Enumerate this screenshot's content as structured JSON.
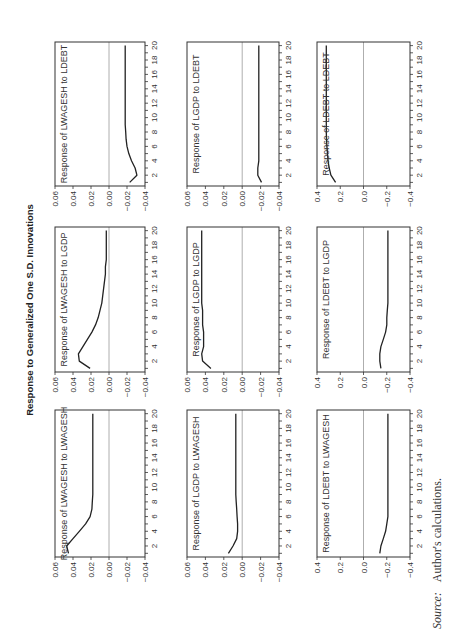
{
  "chart_data": {
    "type": "line",
    "title": "Response to Generalized One S.D. Innovations",
    "orientation_note": "figure rotated 90 degrees counter-clockwise on page",
    "x": [
      1,
      2,
      3,
      4,
      5,
      6,
      7,
      8,
      9,
      10,
      11,
      12,
      13,
      14,
      15,
      16,
      17,
      18,
      19,
      20
    ],
    "xticks": [
      2,
      4,
      6,
      8,
      10,
      12,
      14,
      16,
      18,
      20
    ],
    "panels": [
      {
        "row": 0,
        "col": 0,
        "title": "Response of LWAGESH to LWAGESH",
        "ylim": [
          -0.04,
          0.06
        ],
        "yticks": [
          0.06,
          0.04,
          0.02,
          0.0,
          -0.02,
          -0.04
        ],
        "ytick_labels": [
          "0.06",
          "0.04",
          "0.02",
          "0.00",
          "−0.02",
          "−0.04"
        ],
        "values": [
          0.045,
          0.047,
          0.04,
          0.033,
          0.026,
          0.021,
          0.019,
          0.0185,
          0.018,
          0.018,
          0.018,
          0.018,
          0.018,
          0.018,
          0.018,
          0.018,
          0.018,
          0.018,
          0.018,
          0.018
        ]
      },
      {
        "row": 0,
        "col": 1,
        "title": "Response of LWAGESH to LGDP",
        "ylim": [
          -0.04,
          0.06
        ],
        "yticks": [
          0.06,
          0.04,
          0.02,
          0.0,
          -0.02,
          -0.04
        ],
        "ytick_labels": [
          "0.06",
          "0.04",
          "0.02",
          "0.00",
          "−0.02",
          "−0.04"
        ],
        "values": [
          0.021,
          0.033,
          0.034,
          0.029,
          0.024,
          0.019,
          0.015,
          0.012,
          0.01,
          0.008,
          0.007,
          0.006,
          0.005,
          0.004,
          0.004,
          0.003,
          0.003,
          0.003,
          0.003,
          0.003
        ]
      },
      {
        "row": 0,
        "col": 2,
        "title": "Response of LWAGESH to LDEBT",
        "ylim": [
          -0.04,
          0.06
        ],
        "yticks": [
          0.06,
          0.04,
          0.02,
          0.0,
          -0.02,
          -0.04
        ],
        "ytick_labels": [
          "0.06",
          "0.04",
          "0.02",
          "0.00",
          "−0.02",
          "−0.04"
        ],
        "values": [
          -0.023,
          -0.031,
          -0.029,
          -0.025,
          -0.022,
          -0.02,
          -0.019,
          -0.0185,
          -0.018,
          -0.018,
          -0.018,
          -0.018,
          -0.018,
          -0.018,
          -0.018,
          -0.018,
          -0.018,
          -0.018,
          -0.018,
          -0.018
        ]
      },
      {
        "row": 1,
        "col": 0,
        "title": "Response of LGDP to LWAGESH",
        "ylim": [
          -0.04,
          0.06
        ],
        "yticks": [
          0.06,
          0.04,
          0.02,
          0.0,
          -0.02,
          -0.04
        ],
        "ytick_labels": [
          "0.06",
          "0.04",
          "0.02",
          "0.00",
          "−0.02",
          "−0.04"
        ],
        "values": [
          0.015,
          0.01,
          0.006,
          0.005,
          0.005,
          0.0055,
          0.006,
          0.0065,
          0.007,
          0.007,
          0.007,
          0.007,
          0.007,
          0.007,
          0.007,
          0.007,
          0.007,
          0.007,
          0.007,
          0.007
        ]
      },
      {
        "row": 1,
        "col": 1,
        "title": "Response of LGDP to LGDP",
        "ylim": [
          -0.04,
          0.06
        ],
        "yticks": [
          0.06,
          0.04,
          0.02,
          0.0,
          -0.02,
          -0.04
        ],
        "ytick_labels": [
          "0.06",
          "0.04",
          "0.02",
          "0.00",
          "−0.02",
          "−0.04"
        ],
        "values": [
          0.034,
          0.043,
          0.044,
          0.042,
          0.042,
          0.042,
          0.043,
          0.043,
          0.043,
          0.044,
          0.044,
          0.044,
          0.044,
          0.044,
          0.044,
          0.044,
          0.044,
          0.044,
          0.044,
          0.044
        ]
      },
      {
        "row": 1,
        "col": 2,
        "title": "Response of LGDP to LDEBT",
        "ylim": [
          -0.04,
          0.06
        ],
        "yticks": [
          0.06,
          0.04,
          0.02,
          0.0,
          -0.02,
          -0.04
        ],
        "ytick_labels": [
          "0.06",
          "0.04",
          "0.02",
          "0.00",
          "−0.02",
          "−0.04"
        ],
        "values": [
          -0.021,
          -0.017,
          -0.017,
          -0.018,
          -0.018,
          -0.018,
          -0.018,
          -0.018,
          -0.018,
          -0.018,
          -0.018,
          -0.018,
          -0.018,
          -0.018,
          -0.018,
          -0.018,
          -0.018,
          -0.018,
          -0.018,
          -0.018
        ]
      },
      {
        "row": 2,
        "col": 0,
        "title": "Response of LDEBT to LWAGESH",
        "ylim": [
          -0.4,
          0.4
        ],
        "yticks": [
          0.4,
          0.2,
          0.0,
          -0.2,
          -0.4
        ],
        "ytick_labels": [
          "0.4",
          "0.2",
          "0.0",
          "−0.2",
          "−0.4"
        ],
        "values": [
          -0.14,
          -0.15,
          -0.17,
          -0.19,
          -0.2,
          -0.21,
          -0.21,
          -0.21,
          -0.21,
          -0.21,
          -0.21,
          -0.21,
          -0.21,
          -0.21,
          -0.21,
          -0.21,
          -0.21,
          -0.21,
          -0.21,
          -0.21
        ]
      },
      {
        "row": 2,
        "col": 1,
        "title": "Response of LDEBT to LGDP",
        "ylim": [
          -0.4,
          0.4
        ],
        "yticks": [
          0.4,
          0.2,
          0.0,
          -0.2,
          -0.4
        ],
        "ytick_labels": [
          "0.4",
          "0.2",
          "0.0",
          "−0.2",
          "−0.4"
        ],
        "values": [
          -0.15,
          -0.14,
          -0.14,
          -0.15,
          -0.17,
          -0.19,
          -0.2,
          -0.2,
          -0.205,
          -0.21,
          -0.21,
          -0.21,
          -0.21,
          -0.21,
          -0.21,
          -0.21,
          -0.21,
          -0.21,
          -0.21,
          -0.21
        ]
      },
      {
        "row": 2,
        "col": 2,
        "title": "Response of LDEBT to LDEBT",
        "ylim": [
          -0.4,
          0.4
        ],
        "yticks": [
          0.4,
          0.2,
          0.0,
          -0.2,
          -0.4
        ],
        "ytick_labels": [
          "0.4",
          "0.2",
          "0.0",
          "−0.2",
          "−0.4"
        ],
        "values": [
          0.24,
          0.28,
          0.295,
          0.305,
          0.31,
          0.315,
          0.318,
          0.32,
          0.32,
          0.32,
          0.32,
          0.32,
          0.32,
          0.32,
          0.32,
          0.32,
          0.32,
          0.32,
          0.32,
          0.32
        ]
      }
    ],
    "grid": false,
    "legend": null
  },
  "source": {
    "label": "Source:",
    "text": "Author's calculations."
  }
}
